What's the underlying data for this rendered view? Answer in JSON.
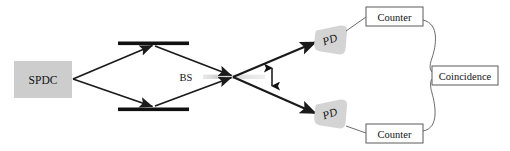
{
  "figure": {
    "name": "spdc-hong-ou-mandel-interferometer-diagram",
    "background_color": "#ffffff"
  },
  "colors": {
    "line": "#1a1a1a",
    "box_stroke": "#5a5a5a",
    "box_fill": "#ffffff",
    "source_fill": "#cdcdcd",
    "detector_fill": "#d4d4d4",
    "mirror": "#111111",
    "beamsplitter_fill": "#d8d8d8",
    "text": "#111111"
  },
  "nodes": {
    "source": {
      "label": "SPDC",
      "shape": "filled-rectangle",
      "x": 14,
      "y": 61,
      "width": 58,
      "height": 37
    },
    "beamsplitter": {
      "label": "BS",
      "shape": "thin-horizontal-bar",
      "label_x": 186,
      "label_y": 77,
      "bar_x": 204,
      "bar_y": 77,
      "bar_width": 60
    },
    "mirror_top": {
      "label": "mirror-top",
      "x1": 118,
      "x2": 189,
      "y": 43,
      "thickness": 4
    },
    "mirror_bottom": {
      "label": "mirror-bottom",
      "x1": 118,
      "x2": 189,
      "y": 109,
      "thickness": 4
    },
    "detector_top": {
      "label": "PD",
      "cx": 331,
      "cy": 40
    },
    "detector_bottom": {
      "label": "PD",
      "cx": 331,
      "cy": 121
    },
    "counter_top": {
      "label": "Counter",
      "x": 366,
      "y": 7,
      "width": 57,
      "height": 19
    },
    "counter_bottom": {
      "label": "Counter",
      "x": 366,
      "y": 124,
      "width": 57,
      "height": 19
    },
    "coincidence": {
      "label": "Coincidence",
      "x": 432,
      "y": 66,
      "width": 66,
      "height": 19
    }
  },
  "annotations": {
    "polarization_arrow": {
      "name": "vertical-double-arrow",
      "x": 272,
      "y_top": 64,
      "y_bottom": 89
    }
  },
  "beam_paths": [
    {
      "name": "source-to-top-mirror",
      "from": "SPDC",
      "to": "mirror-top",
      "arrow": true
    },
    {
      "name": "source-to-bottom-mirror",
      "from": "SPDC",
      "to": "mirror-bottom",
      "arrow": true
    },
    {
      "name": "top-mirror-to-beamsplitter",
      "from": "mirror-top",
      "to": "BS",
      "arrow": true
    },
    {
      "name": "bottom-mirror-to-beamsplitter",
      "from": "mirror-bottom",
      "to": "BS",
      "arrow": true
    },
    {
      "name": "beamsplitter-to-top-detector",
      "from": "BS",
      "to": "PD-top",
      "arrow": true
    },
    {
      "name": "beamsplitter-to-bottom-detector",
      "from": "BS",
      "to": "PD-bottom",
      "arrow": true
    }
  ],
  "wires": [
    {
      "name": "top-detector-to-top-counter",
      "from": "PD-top",
      "to": "Counter-top"
    },
    {
      "name": "bottom-detector-to-bottom-counter",
      "from": "PD-bottom",
      "to": "Counter-bottom"
    },
    {
      "name": "top-counter-to-coincidence",
      "from": "Counter-top",
      "to": "Coincidence"
    },
    {
      "name": "bottom-counter-to-coincidence",
      "from": "Counter-bottom",
      "to": "Coincidence"
    }
  ]
}
